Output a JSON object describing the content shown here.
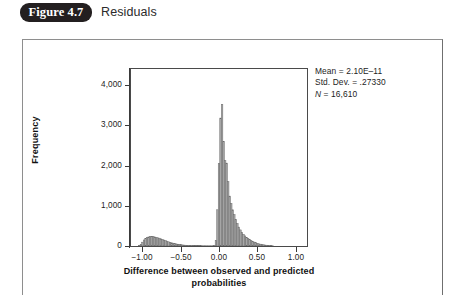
{
  "figure": {
    "badge_label": "Figure 4.7",
    "caption": "Residuals"
  },
  "chart_data": {
    "type": "bar",
    "title": "",
    "xlabel_line1": "Difference between observed and predicted",
    "xlabel_line2": "probabilities",
    "ylabel": "Frequency",
    "xlim": [
      -1.15,
      1.15
    ],
    "ylim": [
      0,
      4400
    ],
    "xticks": [
      -1.0,
      -0.5,
      0.0,
      0.5,
      1.0
    ],
    "xtick_labels": [
      "−1.00",
      "−0.50",
      "0.00",
      "0.50",
      "1.00"
    ],
    "yticks": [
      0,
      1000,
      2000,
      3000,
      4000
    ],
    "ytick_labels": [
      "0",
      "1,000",
      "2,000",
      "3,000",
      "4,000"
    ],
    "grid": false,
    "legend": "none",
    "bar_fill": "#a8a8a8",
    "bar_stroke": "#6a6a6a",
    "bin_width": 0.02,
    "x": [
      -1.04,
      -1.02,
      -1.0,
      -0.98,
      -0.96,
      -0.94,
      -0.92,
      -0.9,
      -0.88,
      -0.86,
      -0.84,
      -0.82,
      -0.8,
      -0.78,
      -0.76,
      -0.74,
      -0.72,
      -0.7,
      -0.68,
      -0.66,
      -0.64,
      -0.62,
      -0.6,
      -0.58,
      -0.56,
      -0.54,
      -0.52,
      -0.5,
      -0.48,
      -0.46,
      -0.44,
      -0.42,
      -0.4,
      -0.38,
      -0.36,
      -0.34,
      -0.32,
      -0.3,
      -0.28,
      -0.26,
      -0.24,
      -0.22,
      -0.2,
      -0.18,
      -0.16,
      -0.14,
      -0.12,
      -0.1,
      -0.08,
      -0.06,
      -0.04,
      -0.02,
      0.0,
      0.02,
      0.04,
      0.06,
      0.08,
      0.1,
      0.12,
      0.14,
      0.16,
      0.18,
      0.2,
      0.22,
      0.24,
      0.26,
      0.28,
      0.3,
      0.32,
      0.34,
      0.36,
      0.38,
      0.4,
      0.42,
      0.44,
      0.46,
      0.48,
      0.5,
      0.52,
      0.54,
      0.56,
      0.58,
      0.6,
      0.62,
      0.64,
      0.66,
      0.68,
      0.7
    ],
    "values": [
      15,
      40,
      95,
      150,
      185,
      210,
      225,
      235,
      240,
      235,
      225,
      215,
      205,
      195,
      180,
      165,
      150,
      135,
      120,
      105,
      92,
      80,
      70,
      60,
      52,
      45,
      38,
      32,
      27,
      23,
      20,
      17,
      15,
      13,
      11,
      10,
      9,
      8,
      8,
      7,
      7,
      6,
      6,
      6,
      5,
      5,
      5,
      5,
      6,
      8,
      140,
      900,
      2050,
      3180,
      3520,
      2600,
      2120,
      2060,
      1600,
      1240,
      1060,
      900,
      780,
      660,
      560,
      470,
      400,
      340,
      290,
      250,
      215,
      185,
      158,
      135,
      115,
      98,
      82,
      68,
      56,
      46,
      38,
      31,
      25,
      20,
      16,
      12,
      9,
      6
    ]
  },
  "stats": {
    "mean_label": "Mean = 2.10E–11",
    "std_dev_label": "Std. Dev. = .27330",
    "n_prefix": "N",
    "n_value": " = 16,610"
  }
}
